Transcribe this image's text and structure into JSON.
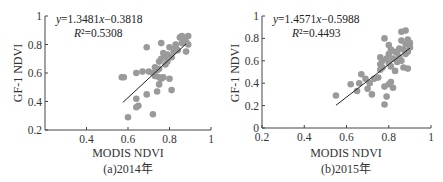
{
  "chart_data": [
    {
      "type": "scatter",
      "caption": "(a)2014年",
      "xlabel": "MODIS NDVI",
      "ylabel": "GF-1 NDVI",
      "xlim": [
        0.2,
        1
      ],
      "ylim": [
        0.2,
        1
      ],
      "xticks": [
        "0.4",
        "0.6",
        "0.8",
        "1"
      ],
      "xtick_values": [
        0.4,
        0.6,
        0.8,
        1
      ],
      "yticks": [
        "0.2",
        "0.4",
        "0.6",
        "0.8",
        "1"
      ],
      "ytick_values": [
        0.2,
        0.4,
        0.6,
        0.8,
        1
      ],
      "equation": "y=1.3481x−0.3818",
      "r2": "R²=0.5308",
      "fit": {
        "slope": 1.3481,
        "intercept": -0.3818,
        "x_range": [
          0.575,
          0.88
        ]
      },
      "point_color": "#9a9a9a",
      "points": [
        [
          0.57,
          0.57
        ],
        [
          0.58,
          0.57
        ],
        [
          0.6,
          0.29
        ],
        [
          0.64,
          0.6
        ],
        [
          0.64,
          0.42
        ],
        [
          0.64,
          0.36
        ],
        [
          0.65,
          0.37
        ],
        [
          0.67,
          0.61
        ],
        [
          0.69,
          0.78
        ],
        [
          0.69,
          0.45
        ],
        [
          0.7,
          0.61
        ],
        [
          0.72,
          0.31
        ],
        [
          0.73,
          0.58
        ],
        [
          0.73,
          0.64
        ],
        [
          0.74,
          0.47
        ],
        [
          0.75,
          0.68
        ],
        [
          0.75,
          0.57
        ],
        [
          0.75,
          0.63
        ],
        [
          0.75,
          0.52
        ],
        [
          0.76,
          0.7
        ],
        [
          0.76,
          0.81
        ],
        [
          0.76,
          0.56
        ],
        [
          0.77,
          0.57
        ],
        [
          0.77,
          0.74
        ],
        [
          0.78,
          0.66
        ],
        [
          0.79,
          0.68
        ],
        [
          0.8,
          0.56
        ],
        [
          0.8,
          0.78
        ],
        [
          0.81,
          0.71
        ],
        [
          0.81,
          0.48
        ],
        [
          0.82,
          0.75
        ],
        [
          0.83,
          0.78
        ],
        [
          0.84,
          0.76
        ],
        [
          0.85,
          0.85
        ],
        [
          0.86,
          0.86
        ],
        [
          0.86,
          0.81
        ],
        [
          0.87,
          0.84
        ],
        [
          0.88,
          0.75
        ],
        [
          0.88,
          0.82
        ],
        [
          0.89,
          0.86
        ],
        [
          0.89,
          0.8
        ],
        [
          0.78,
          0.72
        ],
        [
          0.74,
          0.62
        ],
        [
          0.79,
          0.73
        ],
        [
          0.83,
          0.8
        ],
        [
          0.72,
          0.6
        ]
      ]
    },
    {
      "type": "scatter",
      "caption": "(b)2015年",
      "xlabel": "MODIS NDVI",
      "ylabel": "GF-1 NDVI",
      "xlim": [
        0.2,
        1
      ],
      "ylim": [
        0,
        1
      ],
      "xticks": [
        "0.2",
        "0.4",
        "0.6",
        "0.8",
        "1"
      ],
      "xtick_values": [
        0.2,
        0.4,
        0.6,
        0.8,
        1
      ],
      "yticks": [
        "0",
        "0.2",
        "0.4",
        "0.6",
        "0.8",
        "1"
      ],
      "ytick_values": [
        0,
        0.2,
        0.4,
        0.6,
        0.8,
        1
      ],
      "equation": "y=1.4571x−0.5988",
      "r2": "R²=0.4493",
      "fit": {
        "slope": 1.4571,
        "intercept": -0.5988,
        "x_range": [
          0.55,
          0.9
        ]
      },
      "point_color": "#9a9a9a",
      "points": [
        [
          0.55,
          0.29
        ],
        [
          0.62,
          0.39
        ],
        [
          0.65,
          0.33
        ],
        [
          0.66,
          0.4
        ],
        [
          0.67,
          0.48
        ],
        [
          0.69,
          0.44
        ],
        [
          0.7,
          0.35
        ],
        [
          0.71,
          0.4
        ],
        [
          0.72,
          0.3
        ],
        [
          0.73,
          0.44
        ],
        [
          0.75,
          0.45
        ],
        [
          0.76,
          0.52
        ],
        [
          0.76,
          0.57
        ],
        [
          0.76,
          0.63
        ],
        [
          0.77,
          0.54
        ],
        [
          0.77,
          0.6
        ],
        [
          0.78,
          0.37
        ],
        [
          0.78,
          0.8
        ],
        [
          0.78,
          0.21
        ],
        [
          0.79,
          0.28
        ],
        [
          0.79,
          0.62
        ],
        [
          0.8,
          0.39
        ],
        [
          0.8,
          0.58
        ],
        [
          0.8,
          0.66
        ],
        [
          0.8,
          0.74
        ],
        [
          0.81,
          0.41
        ],
        [
          0.81,
          0.55
        ],
        [
          0.81,
          0.7
        ],
        [
          0.82,
          0.36
        ],
        [
          0.82,
          0.62
        ],
        [
          0.83,
          0.51
        ],
        [
          0.83,
          0.68
        ],
        [
          0.84,
          0.59
        ],
        [
          0.84,
          0.67
        ],
        [
          0.85,
          0.63
        ],
        [
          0.85,
          0.71
        ],
        [
          0.86,
          0.6
        ],
        [
          0.86,
          0.78
        ],
        [
          0.86,
          0.86
        ],
        [
          0.87,
          0.54
        ],
        [
          0.87,
          0.7
        ],
        [
          0.88,
          0.87
        ],
        [
          0.88,
          0.66
        ],
        [
          0.88,
          0.75
        ],
        [
          0.89,
          0.53
        ],
        [
          0.89,
          0.68
        ],
        [
          0.89,
          0.79
        ],
        [
          0.9,
          0.72
        ],
        [
          0.9,
          0.76
        ]
      ]
    }
  ]
}
